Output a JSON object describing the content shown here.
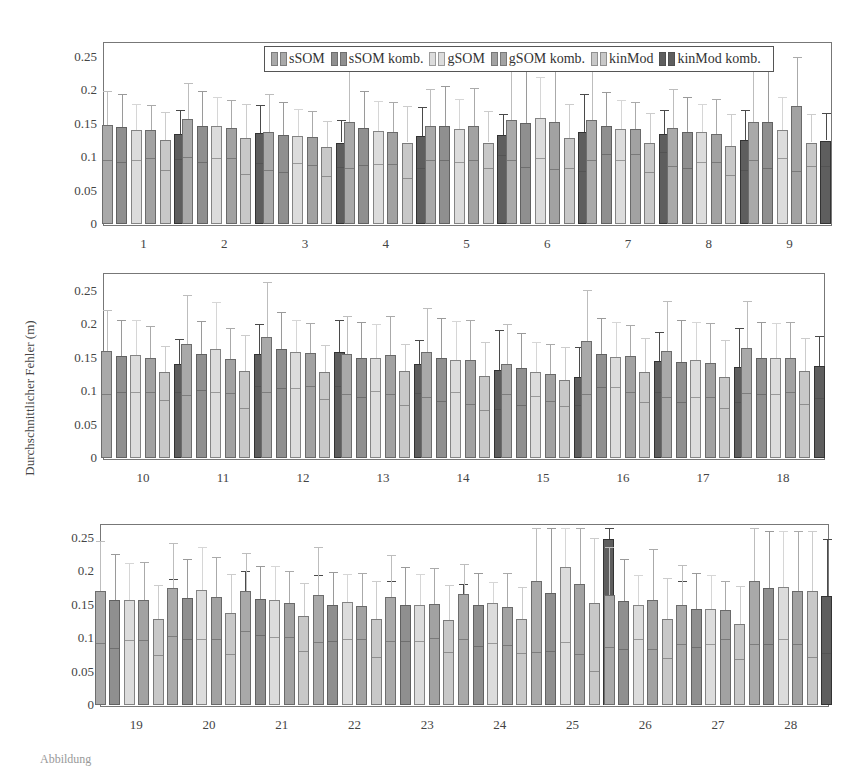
{
  "chart_data": {
    "type": "bar",
    "title": "",
    "xlabel": "",
    "ylabel": "Durchschnittlicher Fehler (m)",
    "ylim": [
      0,
      0.27
    ],
    "yticks": [
      "0",
      "0.05",
      "0.1",
      "0.15",
      "0.2",
      "0.25"
    ],
    "grid": false,
    "legend_position": "top-right inside first panel",
    "series_names": [
      "sSOM",
      "sSOM komb.",
      "gSOM",
      "gSOM komb.",
      "kinMod",
      "kinMod komb."
    ],
    "series_colors": [
      "#a9a9a9",
      "#8f8f8f",
      "#dcdcdc",
      "#a2a2a2",
      "#c8c8c8",
      "#5e5e5e"
    ],
    "error_colors": [
      "#bdbdbd",
      "#9a9a9a",
      "#d6d6d6",
      "#aaaaaa",
      "#cccccc",
      "#4a4a4a"
    ],
    "panels": [
      {
        "categories": [
          "1",
          "2",
          "3",
          "4",
          "5",
          "6",
          "7",
          "8",
          "9"
        ],
        "series": [
          {
            "name": "sSOM",
            "values": [
              0.148,
              0.157,
              0.138,
              0.153,
              0.147,
              0.155,
              0.155,
              0.143,
              0.153
            ],
            "err_top": [
              0.199,
              0.211,
              0.195,
              0.25,
              0.202,
              0.26,
              0.25,
              0.202,
              0.25
            ],
            "lower": [
              0.097,
              0.102,
              0.082,
              0.086,
              0.098,
              0.098,
              0.097,
              0.088,
              0.098
            ]
          },
          {
            "name": "sSOM komb.",
            "values": [
              0.145,
              0.147,
              0.133,
              0.144,
              0.147,
              0.151,
              0.147,
              0.137,
              0.153
            ],
            "err_top": [
              0.194,
              0.199,
              0.183,
              0.199,
              0.207,
              0.26,
              0.198,
              0.19,
              0.25
            ],
            "lower": [
              0.095,
              0.095,
              0.08,
              0.09,
              0.098,
              0.087,
              0.106,
              0.086,
              0.086
            ]
          },
          {
            "name": "gSOM",
            "values": [
              0.141,
              0.146,
              0.132,
              0.139,
              0.142,
              0.158,
              0.142,
              0.137,
              0.14
            ],
            "err_top": [
              0.18,
              0.19,
              0.172,
              0.184,
              0.187,
              0.22,
              0.185,
              0.18,
              0.19
            ],
            "lower": [
              0.098,
              0.1,
              0.093,
              0.092,
              0.094,
              0.1,
              0.098,
              0.095,
              0.1
            ]
          },
          {
            "name": "gSOM komb.",
            "values": [
              0.14,
              0.144,
              0.13,
              0.137,
              0.147,
              0.153,
              0.142,
              0.135,
              0.177
            ],
            "err_top": [
              0.178,
              0.186,
              0.169,
              0.182,
              0.204,
              0.25,
              0.182,
              0.187,
              0.25
            ],
            "lower": [
              0.101,
              0.1,
              0.09,
              0.092,
              0.098,
              0.084,
              0.107,
              0.095,
              0.081
            ]
          },
          {
            "name": "kinMod",
            "values": [
              0.126,
              0.128,
              0.115,
              0.122,
              0.122,
              0.129,
              0.121,
              0.117,
              0.122
            ],
            "err_top": [
              0.168,
              0.179,
              0.154,
              0.177,
              0.169,
              0.18,
              0.166,
              0.164,
              0.165
            ],
            "lower": [
              0.083,
              0.077,
              0.074,
              0.071,
              0.085,
              0.086,
              0.08,
              0.075,
              0.088
            ]
          },
          {
            "name": "kinMod komb.",
            "values": [
              0.135,
              0.136,
              0.122,
              0.131,
              0.133,
              0.137,
              0.135,
              0.126,
              0.125
            ],
            "err_top": [
              0.17,
              0.178,
              0.156,
              0.175,
              0.165,
              0.195,
              0.17,
              0.171,
              0.166
            ],
            "lower": [
              0.099,
              0.093,
              0.087,
              0.086,
              0.105,
              0.081,
              0.109,
              0.083,
              0.088
            ]
          }
        ]
      },
      {
        "categories": [
          "10",
          "11",
          "12",
          "13",
          "14",
          "15",
          "16",
          "17",
          "18"
        ],
        "series": [
          {
            "name": "sSOM",
            "values": [
              0.16,
              0.17,
              0.181,
              0.156,
              0.158,
              0.14,
              0.175,
              0.16,
              0.165
            ],
            "err_top": [
              0.222,
              0.244,
              0.263,
              0.213,
              0.224,
              0.2,
              0.251,
              0.235,
              0.235
            ],
            "lower": [
              0.098,
              0.096,
              0.1,
              0.098,
              0.093,
              0.098,
              0.098,
              0.093,
              0.099
            ]
          },
          {
            "name": "sSOM komb.",
            "values": [
              0.153,
              0.155,
              0.163,
              0.149,
              0.15,
              0.135,
              0.156,
              0.143,
              0.15
            ],
            "err_top": [
              0.206,
              0.205,
              0.218,
              0.203,
              0.21,
              0.187,
              0.21,
              0.206,
              0.204
            ],
            "lower": [
              0.1,
              0.103,
              0.107,
              0.093,
              0.087,
              0.081,
              0.108,
              0.086,
              0.098
            ]
          },
          {
            "name": "gSOM",
            "values": [
              0.154,
              0.163,
              0.158,
              0.15,
              0.146,
              0.128,
              0.151,
              0.146,
              0.15
            ],
            "err_top": [
              0.206,
              0.233,
              0.206,
              0.2,
              0.205,
              0.174,
              0.203,
              0.204,
              0.202
            ],
            "lower": [
              0.101,
              0.1,
              0.107,
              0.102,
              0.101,
              0.094,
              0.108,
              0.093,
              0.098
            ]
          },
          {
            "name": "gSOM komb.",
            "values": [
              0.149,
              0.148,
              0.157,
              0.154,
              0.146,
              0.126,
              0.152,
              0.142,
              0.15
            ],
            "err_top": [
              0.198,
              0.195,
              0.202,
              0.212,
              0.207,
              0.171,
              0.199,
              0.202,
              0.203
            ],
            "lower": [
              0.101,
              0.099,
              0.11,
              0.098,
              0.083,
              0.087,
              0.101,
              0.093,
              0.101
            ]
          },
          {
            "name": "kinMod",
            "values": [
              0.128,
              0.13,
              0.129,
              0.13,
              0.123,
              0.117,
              0.128,
              0.121,
              0.13
            ],
            "err_top": [
              0.167,
              0.184,
              0.169,
              0.171,
              0.173,
              0.166,
              0.179,
              0.177,
              0.18
            ],
            "lower": [
              0.088,
              0.077,
              0.09,
              0.081,
              0.074,
              0.079,
              0.085,
              0.077,
              0.082
            ]
          },
          {
            "name": "kinMod komb.",
            "values": [
              0.14,
              0.156,
              0.159,
              0.14,
              0.132,
              0.122,
              0.145,
              0.136,
              0.137
            ],
            "err_top": [
              0.178,
              0.2,
              0.206,
              0.176,
              0.191,
              0.166,
              0.188,
              0.194,
              0.183
            ],
            "lower": [
              0.101,
              0.109,
              0.109,
              0.099,
              0.075,
              0.081,
              0.101,
              0.085,
              0.092
            ]
          }
        ]
      },
      {
        "categories": [
          "19",
          "20",
          "21",
          "22",
          "23",
          "24",
          "25",
          "26",
          "27",
          "28"
        ],
        "series": [
          {
            "name": "sSOM",
            "values": [
              0.171,
              0.175,
              0.17,
              0.165,
              0.161,
              0.166,
              0.186,
              0.165,
              0.15,
              0.186
            ],
            "err_top": [
              0.246,
              0.243,
              0.228,
              0.236,
              0.224,
              0.211,
              0.27,
              0.236,
              0.21,
              0.27
            ],
            "lower": [
              0.095,
              0.105,
              0.112,
              0.096,
              0.098,
              0.1,
              0.081,
              0.089,
              0.093,
              0.093
            ]
          },
          {
            "name": "sSOM komb.",
            "values": [
              0.157,
              0.16,
              0.159,
              0.149,
              0.15,
              0.149,
              0.167,
              0.156,
              0.143,
              0.175
            ],
            "err_top": [
              0.226,
              0.219,
              0.208,
              0.199,
              0.207,
              0.198,
              0.27,
              0.218,
              0.197,
              0.26
            ],
            "lower": [
              0.087,
              0.101,
              0.107,
              0.098,
              0.098,
              0.09,
              0.083,
              0.085,
              0.088,
              0.093
            ]
          },
          {
            "name": "gSOM",
            "values": [
              0.157,
              0.172,
              0.157,
              0.154,
              0.15,
              0.152,
              0.206,
              0.15,
              0.143,
              0.177
            ],
            "err_top": [
              0.212,
              0.237,
              0.208,
              0.196,
              0.196,
              0.184,
              0.27,
              0.195,
              0.194,
              0.26
            ],
            "lower": [
              0.099,
              0.101,
              0.104,
              0.1,
              0.097,
              0.094,
              0.096,
              0.1,
              0.093,
              0.1
            ]
          },
          {
            "name": "gSOM komb.",
            "values": [
              0.157,
              0.162,
              0.153,
              0.148,
              0.151,
              0.147,
              0.181,
              0.157,
              0.142,
              0.171
            ],
            "err_top": [
              0.214,
              0.221,
              0.201,
              0.197,
              0.205,
              0.197,
              0.27,
              0.233,
              0.186,
              0.26
            ],
            "lower": [
              0.099,
              0.101,
              0.104,
              0.1,
              0.102,
              0.091,
              0.078,
              0.085,
              0.1,
              0.093
            ]
          },
          {
            "name": "kinMod",
            "values": [
              0.128,
              0.137,
              0.133,
              0.129,
              0.127,
              0.128,
              0.152,
              0.128,
              0.121,
              0.17
            ],
            "err_top": [
              0.18,
              0.196,
              0.182,
              0.185,
              0.18,
              0.176,
              0.25,
              0.19,
              0.178,
              0.26
            ],
            "lower": [
              0.077,
              0.078,
              0.082,
              0.074,
              0.081,
              0.08,
              0.053,
              0.072,
              0.071,
              0.074
            ]
          },
          {
            "name": "kinMod komb.",
            "values": [
              0.141,
              0.146,
              0.148,
              0.142,
              0.134,
              0.135,
              0.249,
              0.138,
              0.132,
              0.163
            ],
            "err_top": [
              0.188,
              0.2,
              0.194,
              0.186,
              0.181,
              0.185,
              0.27,
              0.185,
              0.181,
              0.249
            ],
            "lower": [
              0.093,
              0.091,
              0.102,
              0.095,
              0.094,
              0.086,
              0.126,
              0.095,
              0.092,
              0.08
            ]
          }
        ]
      }
    ]
  },
  "labels": {
    "ylabel": "Durchschnittlicher Fehler (m)",
    "legend": [
      "sSOM",
      "sSOM komb.",
      "gSOM",
      "gSOM komb.",
      "kinMod",
      "kinMod komb."
    ],
    "caption": "Abbildung"
  }
}
